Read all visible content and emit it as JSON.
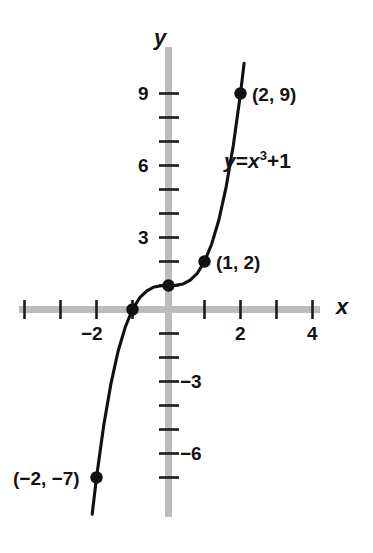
{
  "figure": {
    "kind": "cartesian-graph",
    "background_color": "#ffffff",
    "axis_color": "#b7b7b7",
    "tick_color": "#1b1b1b",
    "curve_color": "#111111",
    "point_color": "#111111"
  },
  "axes": {
    "x_axis_label": "x",
    "y_axis_label": "y",
    "x_ticks": [
      -4,
      -3,
      -2,
      -1,
      1,
      2,
      3,
      4
    ],
    "y_ticks": [
      1,
      2,
      3,
      4,
      5,
      6,
      7,
      8,
      9,
      -1,
      -2,
      -3,
      -4,
      -5,
      -6,
      -7
    ],
    "x_tick_labels": [
      {
        "value": -2,
        "text": "−2"
      },
      {
        "value": 2,
        "text": "2"
      },
      {
        "value": 4,
        "text": "4"
      }
    ],
    "y_tick_labels": [
      {
        "value": 9,
        "text": "9"
      },
      {
        "value": 6,
        "text": "6"
      },
      {
        "value": 3,
        "text": "3"
      },
      {
        "value": -3,
        "text": "−3"
      },
      {
        "value": -6,
        "text": "−6"
      }
    ],
    "xlim": [
      -4.6,
      5.1
    ],
    "ylim": [
      -8.3,
      10.3
    ]
  },
  "equation": {
    "lhs": "y",
    "equals": "=",
    "base": "x",
    "exponent": "3",
    "plus": "+",
    "constant": "1",
    "plain": "y = x³ + 1"
  },
  "point_labels": [
    {
      "text": "(2, 9)",
      "point": "p29"
    },
    {
      "text": "(1, 2)",
      "point": "p12"
    },
    {
      "text": "(−2, −7)",
      "point": "pm2m7"
    }
  ],
  "chart_data": {
    "type": "line",
    "title": "",
    "subtitle": "",
    "xlabel": "x",
    "ylabel": "y",
    "equation": "y = x^3 + 1",
    "grid": false,
    "legend": null,
    "xlim": [
      -4.6,
      5.1
    ],
    "ylim": [
      -8.3,
      10.3
    ],
    "xticks": [
      -4,
      -3,
      -2,
      -1,
      1,
      2,
      3,
      4
    ],
    "yticks": [
      -7,
      -6,
      -5,
      -4,
      -3,
      -2,
      -1,
      1,
      2,
      3,
      4,
      5,
      6,
      7,
      8,
      9
    ],
    "xtick_labels": [
      "",
      "",
      "−2",
      "",
      "",
      "2",
      "",
      "4"
    ],
    "ytick_labels": [
      "",
      "−6",
      "",
      "",
      "−3",
      "",
      "",
      "",
      "",
      "3",
      "",
      "",
      "6",
      "",
      "",
      "9"
    ],
    "series": [
      {
        "name": "y = x^3 + 1",
        "x": [
          -2.12,
          -2.0,
          -1.8,
          -1.6,
          -1.4,
          -1.2,
          -1.0,
          -0.8,
          -0.6,
          -0.4,
          -0.2,
          0.0,
          0.2,
          0.4,
          0.6,
          0.8,
          1.0,
          1.2,
          1.4,
          1.6,
          1.8,
          2.0,
          2.1
        ],
        "y": [
          -8.53,
          -7.0,
          -4.83,
          -3.1,
          -1.74,
          -0.73,
          0.0,
          0.49,
          0.78,
          0.94,
          0.99,
          1.0,
          1.01,
          1.06,
          1.22,
          1.51,
          2.0,
          2.73,
          3.74,
          5.1,
          6.83,
          9.0,
          10.26
        ]
      }
    ],
    "annotated_points": [
      {
        "label": "(2, 9)",
        "x": 2,
        "y": 9
      },
      {
        "label": "(1, 2)",
        "x": 1,
        "y": 2
      },
      {
        "label": "",
        "x": 0,
        "y": 1
      },
      {
        "label": "",
        "x": -1,
        "y": 0
      },
      {
        "label": "(−2, −7)",
        "x": -2,
        "y": -7
      }
    ]
  }
}
